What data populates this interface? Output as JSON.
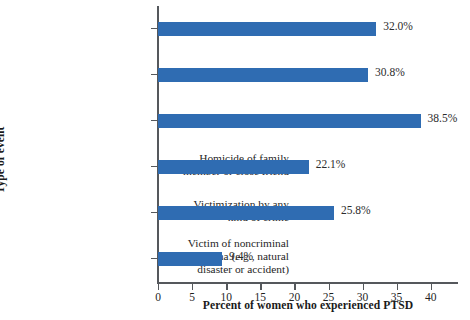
{
  "chart_data": {
    "type": "bar",
    "orientation": "horizontal",
    "title": "",
    "xlabel": "Percent of women who experienced PTSD",
    "ylabel": "Type of event",
    "xlim": [
      0,
      44
    ],
    "xticks": [
      0,
      5,
      10,
      15,
      20,
      25,
      30,
      35,
      40
    ],
    "xtick_labels": [
      "0",
      "5",
      "10",
      "15",
      "20",
      "25",
      "30",
      "35",
      "40"
    ],
    "grid": false,
    "legend": false,
    "bar_color": "#2f6cb2",
    "categories": [
      "Rape",
      "Other sexual assault",
      "Physical assault",
      "Homicide of family\nmember or close friend",
      "Victimization by any\nkind of crime",
      "Victim of noncriminal\ntrauma (e.g., natural\ndisaster or accident)"
    ],
    "values": [
      32.0,
      30.8,
      38.5,
      22.1,
      25.8,
      9.4
    ],
    "value_labels": [
      "32.0%",
      "30.8%",
      "38.5%",
      "22.1%",
      "25.8%",
      "9.4%"
    ]
  }
}
